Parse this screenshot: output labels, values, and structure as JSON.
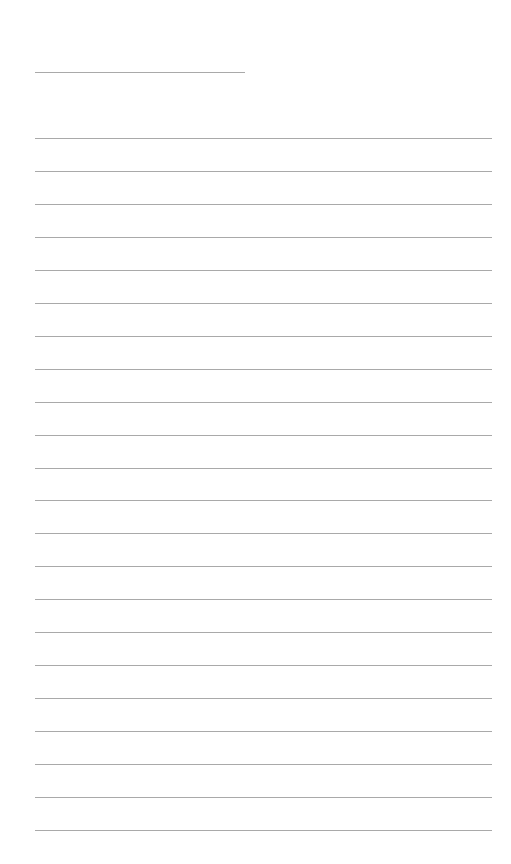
{
  "page": {
    "type": "lined-paper",
    "background": "#ffffff",
    "line_color": "#a9a9a9",
    "header_line": {
      "left": 35,
      "top": 72,
      "width": 210
    },
    "rules": {
      "count": 22,
      "first_top": 138,
      "spacing": 32.95,
      "left": 35,
      "width": 457
    }
  }
}
